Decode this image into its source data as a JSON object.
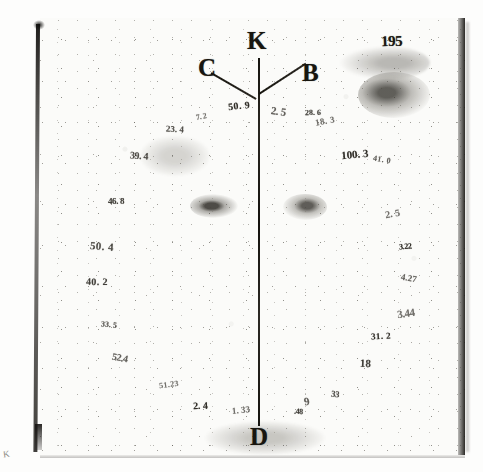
{
  "document": {
    "folio_number": "195",
    "corner_mark": "K"
  },
  "diagram": {
    "labels": {
      "apex": "K",
      "left_ray": "C",
      "right_ray": "B",
      "base": "D"
    }
  },
  "annotations": [
    {
      "id": "n01",
      "text": "7. 2",
      "x": 196,
      "y": 112
    },
    {
      "id": "n02",
      "text": "23. 4",
      "x": 166,
      "y": 124
    },
    {
      "id": "n03",
      "text": "50. 9",
      "x": 228,
      "y": 100
    },
    {
      "id": "n04",
      "text": "2. 5",
      "x": 271,
      "y": 105
    },
    {
      "id": "n05",
      "text": "28. 6",
      "x": 305,
      "y": 108
    },
    {
      "id": "n06",
      "text": "18. 3",
      "x": 315,
      "y": 116
    },
    {
      "id": "n07",
      "text": "39. 4",
      "x": 130,
      "y": 150
    },
    {
      "id": "n08",
      "text": "100. 3",
      "x": 341,
      "y": 148
    },
    {
      "id": "n09",
      "text": "41. 0",
      "x": 373,
      "y": 155
    },
    {
      "id": "n10",
      "text": "46. 8",
      "x": 108,
      "y": 196
    },
    {
      "id": "n11",
      "text": "2. 5",
      "x": 385,
      "y": 208
    },
    {
      "id": "n12",
      "text": "50. 4",
      "x": 90,
      "y": 240
    },
    {
      "id": "n13",
      "text": "3.22",
      "x": 399,
      "y": 242
    },
    {
      "id": "n14",
      "text": "4.27",
      "x": 401,
      "y": 273
    },
    {
      "id": "n15",
      "text": "40. 2",
      "x": 86,
      "y": 276
    },
    {
      "id": "n16",
      "text": "3.44",
      "x": 397,
      "y": 307
    },
    {
      "id": "n17",
      "text": "33. 5",
      "x": 101,
      "y": 320
    },
    {
      "id": "n18",
      "text": "31. 2",
      "x": 371,
      "y": 331
    },
    {
      "id": "n19",
      "text": "52.4",
      "x": 112,
      "y": 352
    },
    {
      "id": "n20",
      "text": "18",
      "x": 360,
      "y": 357
    },
    {
      "id": "n21",
      "text": "51.23",
      "x": 159,
      "y": 380
    },
    {
      "id": "n22",
      "text": "33",
      "x": 331,
      "y": 389
    },
    {
      "id": "n23",
      "text": "2. 4",
      "x": 193,
      "y": 400
    },
    {
      "id": "n24",
      "text": "9",
      "x": 304,
      "y": 395
    },
    {
      "id": "n25",
      "text": ".48",
      "x": 294,
      "y": 407
    },
    {
      "id": "n26",
      "text": "1. 33",
      "x": 232,
      "y": 405
    }
  ]
}
